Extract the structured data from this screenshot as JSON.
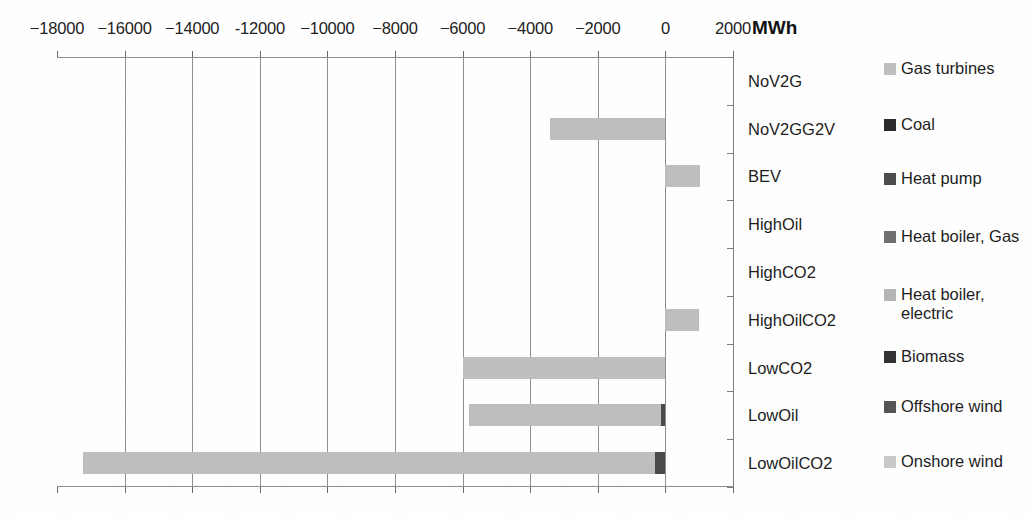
{
  "chart_data": {
    "type": "bar",
    "title": "",
    "orientation": "horizontal",
    "unit_label": "MWh",
    "xlabel": "MWh",
    "ylabel": "",
    "xlim": [
      -19000,
      2200
    ],
    "grid": true,
    "legend_position": "right",
    "axis_tick_labels": [
      "−18000",
      "−16000",
      "−14000",
      "-12000",
      "−10000",
      "−8000",
      "−6000",
      "−4000",
      "−2000",
      "0",
      "2000"
    ],
    "axis_tick_values": [
      -18000,
      -16000,
      -14000,
      -12000,
      -10000,
      -8000,
      -6000,
      -4000,
      -2000,
      0,
      2000
    ],
    "categories": [
      "NoV2G",
      "NoV2GG2V",
      "BEV",
      "HighOil",
      "HighCO2",
      "HighOilCO2",
      "LowCO2",
      "LowOil",
      "LowOilCO2"
    ],
    "series": [
      {
        "name": "Gas turbines",
        "color": "#bfbfbf",
        "values": [
          0,
          -3400,
          1010,
          0,
          0,
          1000,
          -6000,
          -5680,
          -16950
        ]
      },
      {
        "name": "Coal",
        "color": "#2b2b2b",
        "values": [
          0,
          0,
          0,
          0,
          0,
          0,
          0,
          -120,
          -280
        ]
      },
      {
        "name": "Heat pump",
        "color": "#4d4d4d",
        "values": [
          0,
          0,
          0,
          0,
          0,
          0,
          0,
          0,
          0
        ]
      },
      {
        "name": "Heat boiler, Gas",
        "color": "#707070",
        "values": [
          0,
          0,
          0,
          0,
          0,
          0,
          0,
          0,
          0
        ]
      },
      {
        "name": "Heat boiler, electric",
        "color": "#b5b5b5",
        "values": [
          0,
          0,
          0,
          0,
          0,
          0,
          0,
          0,
          0
        ]
      },
      {
        "name": "Biomass",
        "color": "#333333",
        "values": [
          0,
          0,
          0,
          0,
          0,
          0,
          0,
          0,
          0
        ]
      },
      {
        "name": "Offshore wind",
        "color": "#555555",
        "values": [
          0,
          0,
          0,
          0,
          0,
          0,
          0,
          0,
          0
        ]
      },
      {
        "name": "Onshore wind",
        "color": "#c9c9c9",
        "values": [
          0,
          0,
          0,
          0,
          0,
          0,
          0,
          0,
          0
        ]
      }
    ],
    "bars": [
      {
        "category": "NoV2G",
        "segments": []
      },
      {
        "category": "NoV2GG2V",
        "segments": [
          {
            "series": "Gas turbines",
            "start": -3400,
            "end": 0,
            "color": "#bfbfbf"
          }
        ]
      },
      {
        "category": "BEV",
        "segments": [
          {
            "series": "Gas turbines",
            "start": 0,
            "end": 1010,
            "color": "#bfbfbf"
          }
        ]
      },
      {
        "category": "HighOil",
        "segments": []
      },
      {
        "category": "HighCO2",
        "segments": []
      },
      {
        "category": "HighOilCO2",
        "segments": [
          {
            "series": "Gas turbines",
            "start": 0,
            "end": 1000,
            "color": "#bfbfbf"
          }
        ]
      },
      {
        "category": "LowCO2",
        "segments": [
          {
            "series": "Gas turbines",
            "start": -6000,
            "end": 0,
            "color": "#bfbfbf"
          }
        ]
      },
      {
        "category": "LowOil",
        "segments": [
          {
            "series": "Gas turbines",
            "start": -5800,
            "end": -120,
            "color": "#bfbfbf"
          },
          {
            "series": "Coal",
            "start": -120,
            "end": 0,
            "color": "#4a4a4a"
          }
        ]
      },
      {
        "category": "LowOilCO2",
        "segments": [
          {
            "series": "Gas turbines",
            "start": -17230,
            "end": -300,
            "color": "#bfbfbf"
          },
          {
            "series": "Coal",
            "start": -300,
            "end": 0,
            "color": "#4a4a4a"
          }
        ]
      }
    ]
  },
  "legend": {
    "entries": [
      {
        "label": "Gas turbines",
        "color": "#bfbfbf"
      },
      {
        "label": "Coal",
        "color": "#2b2b2b"
      },
      {
        "label": "Heat pump",
        "color": "#4d4d4d"
      },
      {
        "label": "Heat boiler, Gas",
        "color": "#707070"
      },
      {
        "label": "Heat boiler, electric",
        "color": "#b5b5b5"
      },
      {
        "label": "Biomass",
        "color": "#333333"
      },
      {
        "label": "Offshore wind",
        "color": "#555555"
      },
      {
        "label": "Onshore wind",
        "color": "#c9c9c9"
      }
    ]
  }
}
